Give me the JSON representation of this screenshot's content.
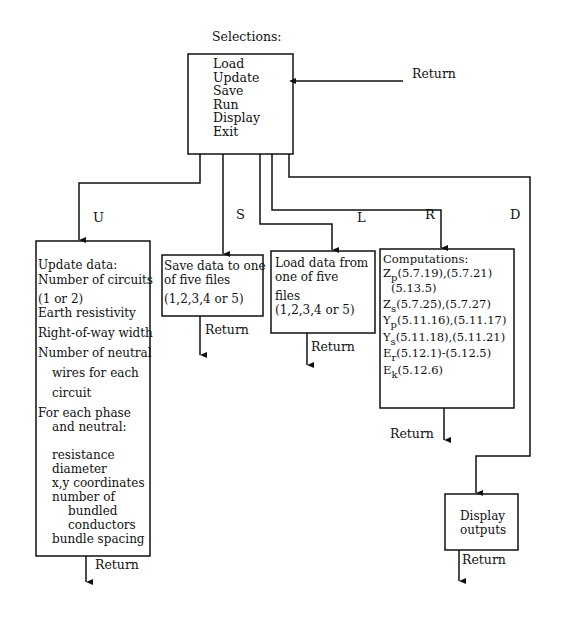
{
  "title": "Selections:",
  "menu": {
    "items": [
      "Load",
      "Update",
      "Save",
      "Run",
      "Display",
      "Exit"
    ],
    "return_label": "Return"
  },
  "branches": {
    "update": "U",
    "save": "S",
    "load": "L",
    "run": "R",
    "display": "D"
  },
  "update_box": {
    "lines": [
      "Update  data:",
      "Number of circuits",
      "(1 or 2)",
      "Earth resistivity",
      "Right-of-way width",
      "Number of neutral",
      "wires for each",
      "circuit",
      "For each phase",
      "and neutral:",
      "resistance",
      "diameter",
      "x,y coordinates",
      "number of",
      "bundled",
      "conductors",
      "bundle spacing"
    ],
    "return_label": "Return"
  },
  "save_box": {
    "lines": [
      "Save data to one",
      "of five files",
      "(1,2,3,4 or 5)"
    ],
    "return_label": "Return"
  },
  "load_box": {
    "lines": [
      "Load data  from",
      "one of five",
      "files",
      "(1,2,3,4 or 5)"
    ],
    "return_label": "Return"
  },
  "computations_box": {
    "title": "Computations:",
    "rows": [
      {
        "var": "Z",
        "sub": "p",
        "refs": "(5.7.19),(5.7.21)"
      },
      {
        "var": "",
        "sub": "",
        "refs": "(5.13.5)"
      },
      {
        "var": "Z",
        "sub": "s",
        "refs": "(5.7.25),(5.7.27)"
      },
      {
        "var": "Y",
        "sub": "p",
        "refs": "(5.11.16),(5.11.17)"
      },
      {
        "var": "Y",
        "sub": "s",
        "refs": "(5.11.18),(5.11.21)"
      },
      {
        "var": "E",
        "sub": "r",
        "refs": "(5.12.1)-(5.12.5)"
      },
      {
        "var": "E",
        "sub": "k",
        "refs": "(5.12.6)"
      }
    ],
    "return_label": "Return"
  },
  "display_box": {
    "lines": [
      "Display",
      "outputs"
    ],
    "return_label": "Return"
  }
}
